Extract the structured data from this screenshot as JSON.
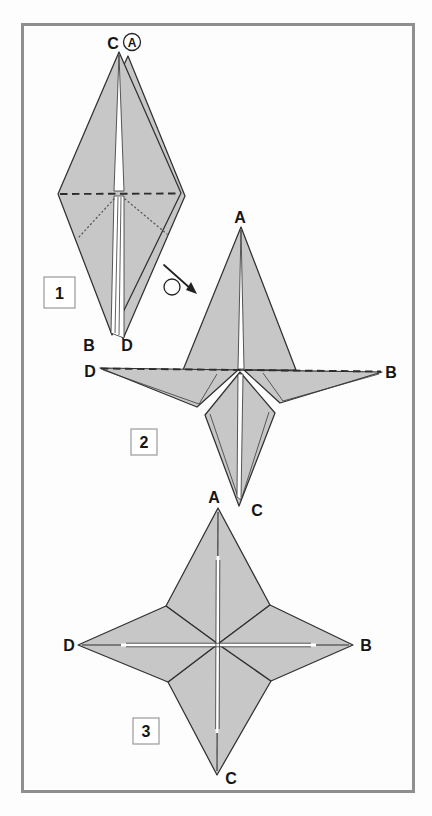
{
  "figure": {
    "type": "origami-instruction-diagram"
  },
  "colors": {
    "paper": "#c7c7c7",
    "outline": "#313131",
    "frame": "#8f8f8f",
    "background": "#fdfdfd"
  },
  "steps": [
    {
      "number": "1",
      "labels": {
        "top": "C",
        "top_circled": "A",
        "bottom_left": "B",
        "bottom_right": "D"
      }
    },
    {
      "number": "2",
      "labels": {
        "top": "A",
        "left": "D",
        "right": "B",
        "bottom": "C"
      }
    },
    {
      "number": "3",
      "labels": {
        "top": "A",
        "left": "D",
        "right": "B",
        "bottom": "C"
      }
    }
  ],
  "icons": {
    "rotate_arrow": "turn-model-over-arrow"
  }
}
